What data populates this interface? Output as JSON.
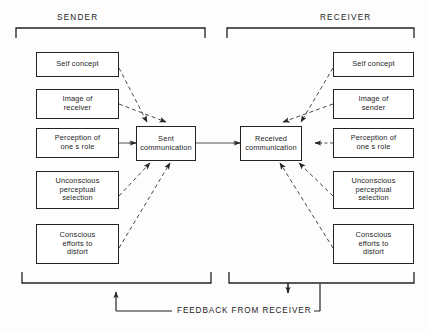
{
  "diagram": {
    "groups": [
      {
        "id": "sender",
        "label": "SENDER"
      },
      {
        "id": "receiver",
        "label": "RECEIVER"
      }
    ],
    "sender_factors": [
      {
        "id": "self-concept",
        "label": "Self concept"
      },
      {
        "id": "image-of-receiver",
        "label": "Image of\nreceiver"
      },
      {
        "id": "perception-of-role",
        "label": "Perception of\none s role"
      },
      {
        "id": "unconscious-perceptual-selection",
        "label": "Unconscious\nperceptual\nselection"
      },
      {
        "id": "conscious-efforts-to-distort",
        "label": "Conscious\nefforts to\ndistort"
      }
    ],
    "receiver_factors": [
      {
        "id": "self-concept",
        "label": "Self concept"
      },
      {
        "id": "image-of-sender",
        "label": "Image of\nsender"
      },
      {
        "id": "perception-of-role",
        "label": "Perception of\none s role"
      },
      {
        "id": "unconscious-perceptual-selection",
        "label": "Unconscious\nperceptual\nselection"
      },
      {
        "id": "conscious-efforts-to-distort",
        "label": "Conscious\nefforts to\ndistort"
      }
    ],
    "hubs": [
      {
        "id": "sent-communication",
        "label": "Sent\ncommunication"
      },
      {
        "id": "received-communication",
        "label": "Received\ncommunication"
      }
    ],
    "feedback": {
      "label": "FEEDBACK FROM RECEIVER"
    },
    "colors": {
      "line": "#232323",
      "dashed_line": "#555555",
      "box_border": "#232323",
      "background": "#fdfdfd",
      "text": "#1c1c1c"
    }
  }
}
